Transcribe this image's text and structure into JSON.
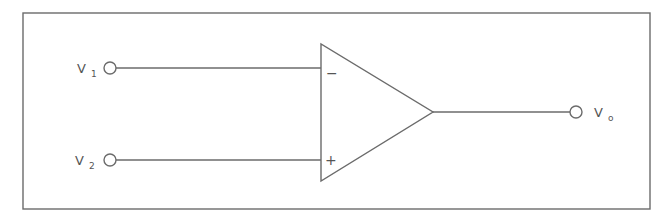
{
  "diagram": {
    "type": "op-amp schematic",
    "colors": {
      "stroke": "#6b6b6b",
      "text": "#555555",
      "background": "#ffffff"
    },
    "inputs": [
      {
        "label": "V",
        "subscript": "1",
        "terminal": "inverting",
        "sign": "−"
      },
      {
        "label": "V",
        "subscript": "2",
        "terminal": "non-inverting",
        "sign": "+"
      }
    ],
    "output": {
      "label": "V",
      "subscript": "o"
    }
  }
}
